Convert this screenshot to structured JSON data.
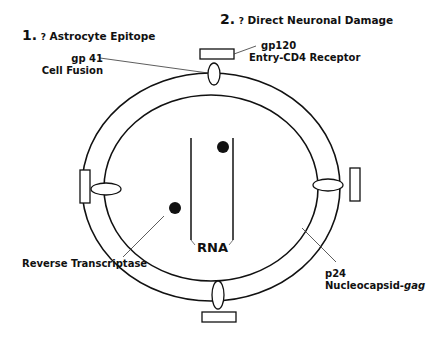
{
  "headers": {
    "h1": {
      "number": "1.",
      "question": "?",
      "text": "Astrocyte Epitope"
    },
    "h2": {
      "number": "2.",
      "question": "?",
      "text": "Direct Neuronal Damage"
    }
  },
  "labels": {
    "gp41": {
      "line1": "gp 41",
      "line2": "Cell Fusion"
    },
    "gp120": {
      "line1": "gp120",
      "line2": "Entry-CD4 Receptor"
    },
    "rna": "RNA",
    "reverse_transcriptase": "Reverse Transcriptase",
    "p24": {
      "line1": "p24",
      "line2_prefix": "Nucleocapsid-",
      "line2_italic": "gag"
    }
  },
  "colors": {
    "stroke": "#111111",
    "background": "#ffffff"
  }
}
